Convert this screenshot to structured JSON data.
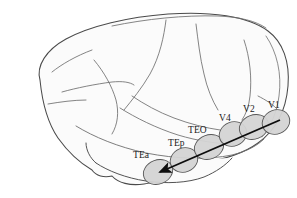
{
  "figure": {
    "background_color": "#ffffff",
    "outline_color": "#4a4a4a",
    "sulci_color": "#6e6e6e",
    "cortex_fill": "#fcfcfc",
    "region_fill": "#d4d4d4",
    "region_stroke": "#555555",
    "arrow_color": "#0d0d0d"
  },
  "regions": [
    {
      "id": "TEa",
      "label": "TEa",
      "label_x": 133,
      "label_y": 158,
      "cx": 158,
      "cy": 172,
      "rx": 15,
      "ry": 12,
      "rotation": -22
    },
    {
      "id": "TEp",
      "label": "TEp",
      "label_x": 168,
      "label_y": 146,
      "cx": 184,
      "cy": 160,
      "rx": 14,
      "ry": 12,
      "rotation": -22
    },
    {
      "id": "TEO",
      "label": "TEO",
      "label_x": 189,
      "label_y": 132,
      "cx": 209,
      "cy": 147,
      "rx": 15,
      "ry": 12,
      "rotation": -22
    },
    {
      "id": "V4",
      "label": "V4",
      "label_x": 219,
      "label_y": 120,
      "cx": 233,
      "cy": 134,
      "rx": 14,
      "ry": 12,
      "rotation": -22
    },
    {
      "id": "V2",
      "label": "V2",
      "label_x": 243,
      "label_y": 111,
      "cx": 254,
      "cy": 127,
      "rx": 15,
      "ry": 12,
      "rotation": -22
    },
    {
      "id": "V1",
      "label": "V1",
      "label_x": 268,
      "label_y": 107,
      "cx": 276,
      "cy": 122,
      "rx": 14,
      "ry": 12,
      "rotation": -22
    }
  ],
  "arrow": {
    "name": "ventral-stream-arrow",
    "direction": "V1 to TEa",
    "start_x": 279,
    "start_y": 121,
    "end_x": 156,
    "end_y": 174,
    "head_size": 9
  }
}
